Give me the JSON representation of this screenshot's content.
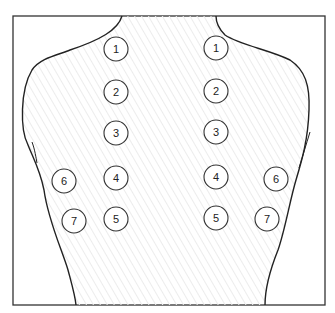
{
  "diagram": {
    "points": [
      {
        "label": "1",
        "x": 116,
        "y": 49
      },
      {
        "label": "2",
        "x": 116,
        "y": 92
      },
      {
        "label": "3",
        "x": 116,
        "y": 133
      },
      {
        "label": "4",
        "x": 116,
        "y": 178
      },
      {
        "label": "5",
        "x": 116,
        "y": 219
      },
      {
        "label": "6",
        "x": 64,
        "y": 181
      },
      {
        "label": "7",
        "x": 74,
        "y": 221
      },
      {
        "label": "1",
        "x": 216,
        "y": 48
      },
      {
        "label": "2",
        "x": 216,
        "y": 91
      },
      {
        "label": "3",
        "x": 216,
        "y": 132
      },
      {
        "label": "4",
        "x": 216,
        "y": 177
      },
      {
        "label": "5",
        "x": 216,
        "y": 218
      },
      {
        "label": "6",
        "x": 276,
        "y": 179
      },
      {
        "label": "7",
        "x": 267,
        "y": 219
      }
    ]
  }
}
